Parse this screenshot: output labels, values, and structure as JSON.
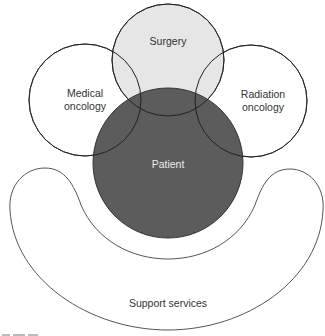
{
  "diagram": {
    "title": "",
    "colors": {
      "surgery_fill": "#e6e6e6",
      "patient_fill": "#5c5c5c",
      "outline": "#444444",
      "background": "#ffffff"
    },
    "nodes": [
      {
        "id": "surgery",
        "label": "Surgery",
        "shape": "circle",
        "cx": 168,
        "cy": 60,
        "r": 56
      },
      {
        "id": "medical",
        "label_line1": "Medical",
        "label_line2": "oncology",
        "shape": "circle",
        "cx": 85,
        "cy": 100,
        "r": 56
      },
      {
        "id": "radiation",
        "label_line1": "Radiation",
        "label_line2": "oncology",
        "shape": "circle",
        "cx": 251,
        "cy": 101,
        "r": 56
      },
      {
        "id": "patient",
        "label": "Patient",
        "shape": "circle",
        "cx": 168,
        "cy": 163,
        "r": 75
      },
      {
        "id": "support",
        "label": "Support services",
        "shape": "crescent"
      }
    ]
  }
}
